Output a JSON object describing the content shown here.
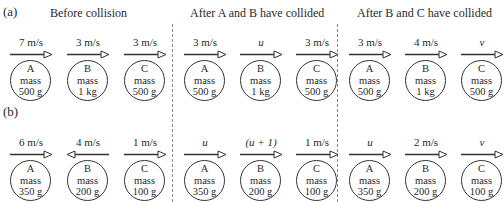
{
  "parts": {
    "a": {
      "label": "(a)"
    },
    "b": {
      "label": "(b)"
    }
  },
  "headings": {
    "before": "Before collision",
    "after_ab": "After A and B have collided",
    "after_bc": "After B and C have collided"
  },
  "mass_word": "mass",
  "rows": {
    "a": {
      "before": [
        {
          "name": "A",
          "mass": "500 g",
          "velocity": "7 m/s",
          "direction": "right",
          "italic": false
        },
        {
          "name": "B",
          "mass": "1 kg",
          "velocity": "3 m/s",
          "direction": "right",
          "italic": false
        },
        {
          "name": "C",
          "mass": "500 g",
          "velocity": "3 m/s",
          "direction": "right",
          "italic": false
        }
      ],
      "after_ab": [
        {
          "name": "A",
          "mass": "500 g",
          "velocity": "3 m/s",
          "direction": "right",
          "italic": false
        },
        {
          "name": "B",
          "mass": "1 kg",
          "velocity": "u",
          "direction": "right",
          "italic": true
        },
        {
          "name": "C",
          "mass": "500 g",
          "velocity": "3 m/s",
          "direction": "right",
          "italic": false
        }
      ],
      "after_bc": [
        {
          "name": "A",
          "mass": "500 g",
          "velocity": "3 m/s",
          "direction": "right",
          "italic": false
        },
        {
          "name": "B",
          "mass": "1 kg",
          "velocity": "4 m/s",
          "direction": "right",
          "italic": false
        },
        {
          "name": "C",
          "mass": "500 g",
          "velocity": "v",
          "direction": "right",
          "italic": true
        }
      ]
    },
    "b": {
      "before": [
        {
          "name": "A",
          "mass": "350 g",
          "velocity": "6 m/s",
          "direction": "right",
          "italic": false
        },
        {
          "name": "B",
          "mass": "200 g",
          "velocity": "4 m/s",
          "direction": "left",
          "italic": false
        },
        {
          "name": "C",
          "mass": "100 g",
          "velocity": "1 m/s",
          "direction": "right",
          "italic": false
        }
      ],
      "after_ab": [
        {
          "name": "A",
          "mass": "350 g",
          "velocity": "u",
          "direction": "right",
          "italic": true
        },
        {
          "name": "B",
          "mass": "200 g",
          "velocity": "(u + 1)",
          "direction": "right",
          "italic": true
        },
        {
          "name": "C",
          "mass": "100 g",
          "velocity": "1 m/s",
          "direction": "right",
          "italic": false
        }
      ],
      "after_bc": [
        {
          "name": "A",
          "mass": "350 g",
          "velocity": "u",
          "direction": "right",
          "italic": true
        },
        {
          "name": "B",
          "mass": "200 g",
          "velocity": "2 m/s",
          "direction": "right",
          "italic": false
        },
        {
          "name": "C",
          "mass": "100 g",
          "velocity": "v",
          "direction": "right",
          "italic": true
        }
      ]
    }
  }
}
